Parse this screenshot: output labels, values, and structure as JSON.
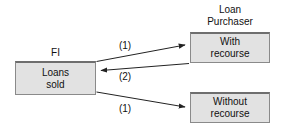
{
  "diagram": {
    "background_color": "#ffffff",
    "node_fill_color": "#e2e2e2",
    "node_border_color": "#8a8a8a",
    "line_color": "#222222",
    "labels": {
      "fi": "FI",
      "purchaser_line1": "Loan",
      "purchaser_line2": "Purchaser"
    },
    "nodes": [
      {
        "id": "fi",
        "line1": "Loans",
        "line2": "sold"
      },
      {
        "id": "with-recourse",
        "line1": "With",
        "line2": "recourse"
      },
      {
        "id": "without-recourse",
        "line1": "Without",
        "line2": "recourse"
      }
    ],
    "edges": [
      {
        "id": "fi-to-with-recourse",
        "label": "(1)",
        "from": "fi",
        "to": "with-recourse",
        "direction": "right"
      },
      {
        "id": "with-recourse-to-fi",
        "label": "(2)",
        "from": "with-recourse",
        "to": "fi",
        "direction": "left"
      },
      {
        "id": "fi-to-without-recourse",
        "label": "(1)",
        "from": "fi",
        "to": "without-recourse",
        "direction": "right"
      }
    ]
  }
}
